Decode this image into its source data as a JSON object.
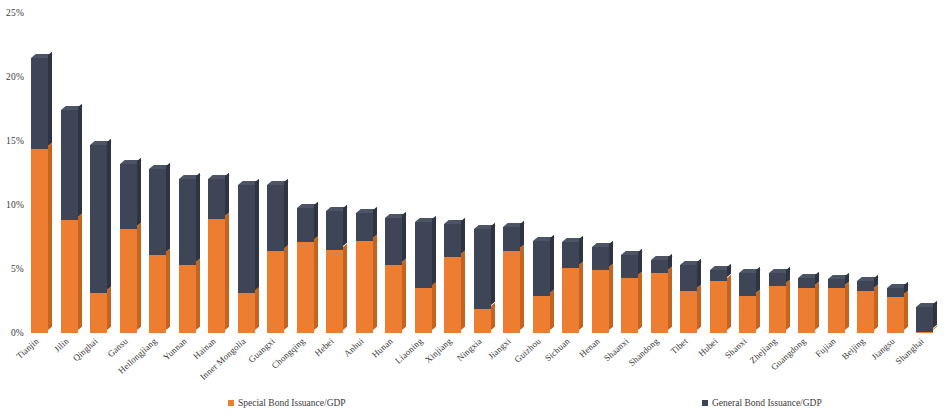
{
  "chart_data": {
    "type": "bar",
    "title": "",
    "subtitle": "",
    "xlabel": "",
    "ylabel": "",
    "stacked": true,
    "grid": false,
    "legend_position": "bottom",
    "ylim": [
      0,
      25
    ],
    "ytick_labels": [
      "25%",
      "20%",
      "15%",
      "10%",
      "5%",
      "0%"
    ],
    "ytick_values": [
      25,
      20,
      15,
      10,
      5,
      0
    ],
    "categories": [
      "Tianjin",
      "Jilin",
      "Qinghai",
      "Gansu",
      "Heilongjiang",
      "Yunnan",
      "Hainan",
      "Inner Mongolia",
      "Guangxi",
      "Chongqing",
      "Hebei",
      "Anhui",
      "Hunan",
      "Liaoning",
      "Xinjiang",
      "Ningxia",
      "Jiangxi",
      "Guizhou",
      "Sichuan",
      "Henan",
      "Shaanxi",
      "Shandong",
      "Tibet",
      "Hubei",
      "Shanxi",
      "Zhejiang",
      "Guangdong",
      "Fujian",
      "Beijing",
      "Jiangsu",
      "Shanghai"
    ],
    "series": [
      {
        "name": "Special Bond Issuance/GDP",
        "color": "#ed7d31",
        "values": [
          14.4,
          8.8,
          3.1,
          8.1,
          6.1,
          5.3,
          8.9,
          3.1,
          6.4,
          7.1,
          6.5,
          7.2,
          5.3,
          3.5,
          5.9,
          1.9,
          6.4,
          2.9,
          5.1,
          4.9,
          4.3,
          4.7,
          3.3,
          4.1,
          2.9,
          3.7,
          3.5,
          3.5,
          3.3,
          2.8,
          0.1
        ]
      },
      {
        "name": "General Bond Issuance/GDP",
        "color": "#3e4556",
        "values": [
          7.1,
          8.6,
          11.6,
          5.1,
          6.7,
          6.7,
          3.1,
          8.5,
          5.2,
          2.7,
          3.0,
          2.2,
          3.7,
          5.2,
          2.6,
          6.2,
          1.9,
          4.3,
          2.0,
          1.8,
          1.8,
          1.0,
          2.0,
          0.8,
          1.8,
          1.0,
          0.8,
          0.7,
          0.8,
          0.7,
          1.9
        ]
      }
    ],
    "totals": [
      21.5,
      17.4,
      14.7,
      13.2,
      12.8,
      12.0,
      12.0,
      11.6,
      11.6,
      9.8,
      9.5,
      9.4,
      9.0,
      8.7,
      8.5,
      8.1,
      8.3,
      7.2,
      7.1,
      6.7,
      6.1,
      5.7,
      5.3,
      4.9,
      4.7,
      4.7,
      4.3,
      4.2,
      4.1,
      3.5,
      2.0
    ]
  },
  "legend": {
    "special_label": "Special Bond Issuance/GDP",
    "general_label": "General Bond Issuance/GDP"
  }
}
